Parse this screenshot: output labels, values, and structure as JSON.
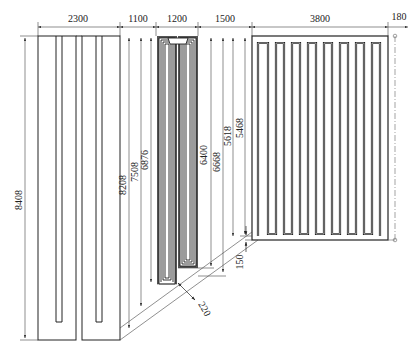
{
  "figure": {
    "type": "technical-drawing",
    "line_color": "#222222",
    "dim_line_color": "#444444"
  },
  "dimensions": {
    "horizontal": [
      {
        "id": "w1",
        "label": "2300"
      },
      {
        "id": "w2",
        "label": "1100"
      },
      {
        "id": "w3",
        "label": "1200"
      },
      {
        "id": "w4",
        "label": "1500"
      },
      {
        "id": "w5",
        "label": "3800"
      },
      {
        "id": "w6",
        "label": "180"
      }
    ],
    "vertical": [
      {
        "id": "h1",
        "label": "8408"
      },
      {
        "id": "h2",
        "label": "8208"
      },
      {
        "id": "h3",
        "label": "7508"
      },
      {
        "id": "h4",
        "label": "6876"
      },
      {
        "id": "h5",
        "label": "6400"
      },
      {
        "id": "h6",
        "label": "6668"
      },
      {
        "id": "h7",
        "label": "5618"
      },
      {
        "id": "h8",
        "label": "5468"
      }
    ],
    "other": [
      {
        "id": "d1",
        "label": "220"
      },
      {
        "id": "d2",
        "label": "150"
      }
    ]
  },
  "panels": [
    {
      "id": "left-panel",
      "description": "two U-loop plates"
    },
    {
      "id": "middle-panel",
      "description": "nested multi-loop U coils"
    },
    {
      "id": "right-panel",
      "description": "serpentine coil with 8 loops"
    }
  ]
}
